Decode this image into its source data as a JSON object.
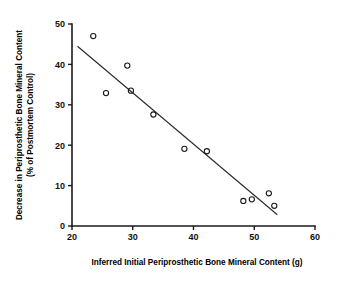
{
  "chart_data": {
    "type": "scatter",
    "title": "",
    "xlabel": "Inferred Initial Periprosthetic Bone Mineral Content (g)",
    "ylabel": "Decrease in Periprosthetic Bone Mineral Content (% of Postmortem Control)",
    "ylabel_line1": "Decrease in Periprosthetic Bone Mineral Content",
    "ylabel_line2": "(% of Postmortem Control)",
    "xlim": [
      20,
      60
    ],
    "ylim": [
      0,
      50
    ],
    "xticks": [
      20,
      30,
      40,
      50,
      60
    ],
    "yticks": [
      0,
      10,
      20,
      30,
      40,
      50
    ],
    "xtick_labels": [
      "20",
      "30",
      "40",
      "50",
      "60"
    ],
    "ytick_labels": [
      "0",
      "10",
      "20",
      "30",
      "40",
      "50"
    ],
    "grid": false,
    "legend": null,
    "marker": "open-circle",
    "point_color": "#1a1a1a",
    "line_color": "#2b2b2b",
    "series": [
      {
        "name": "Specimens",
        "points": [
          {
            "x": 23.5,
            "y": 47.0
          },
          {
            "x": 25.6,
            "y": 32.9
          },
          {
            "x": 29.1,
            "y": 39.7
          },
          {
            "x": 29.7,
            "y": 33.5
          },
          {
            "x": 33.4,
            "y": 27.6
          },
          {
            "x": 38.5,
            "y": 19.1
          },
          {
            "x": 42.2,
            "y": 18.5
          },
          {
            "x": 48.2,
            "y": 6.2
          },
          {
            "x": 49.6,
            "y": 6.6
          },
          {
            "x": 52.4,
            "y": 8.1
          },
          {
            "x": 53.3,
            "y": 5.0
          }
        ]
      }
    ],
    "fit_line": {
      "name": "Linear regression",
      "x_start": 20.9,
      "y_start": 44.5,
      "x_end": 53.8,
      "y_end": 2.8
    }
  }
}
